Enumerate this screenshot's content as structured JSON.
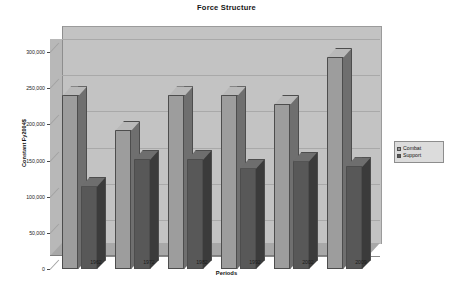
{
  "chart_data": {
    "type": "bar",
    "title": "Force Structure",
    "xlabel": "Periods",
    "ylabel": "Constant Fy2004$",
    "categories": [
      "1962",
      "1972",
      "1982",
      "1992",
      "2002",
      "2009"
    ],
    "series": [
      {
        "name": "Combat",
        "color": "#9d9d9d",
        "values": [
          240000,
          192000,
          240000,
          240000,
          228000,
          293000
        ]
      },
      {
        "name": "Support",
        "color": "#585858",
        "values": [
          115000,
          152000,
          152000,
          140000,
          150000,
          142000
        ]
      }
    ],
    "ylim": [
      0,
      300000
    ],
    "ytick_values": [
      0,
      50000,
      100000,
      150000,
      200000,
      250000,
      300000
    ],
    "ytick_labels": [
      "0",
      "50,000",
      "100,000",
      "150,000",
      "200,000",
      "250,000",
      "300,000"
    ],
    "grid": true,
    "legend_position": "right",
    "style": "3d-column"
  },
  "legend": {
    "items": [
      {
        "label": "Combat"
      },
      {
        "label": "Support"
      }
    ]
  }
}
